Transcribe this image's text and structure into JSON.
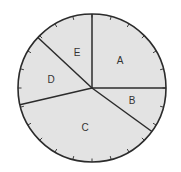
{
  "chart_data": {
    "type": "pie",
    "title": "",
    "categories": [
      "A",
      "B",
      "C",
      "D",
      "E"
    ],
    "values": [
      25,
      10,
      37,
      15,
      13
    ],
    "unit": "percent (estimated from angles)",
    "angles_deg": {
      "A": [
        0,
        90
      ],
      "E": [
        90,
        137
      ],
      "D": [
        137,
        193
      ],
      "C": [
        193,
        324
      ],
      "B": [
        324,
        360
      ]
    },
    "tick_marks": 24,
    "legend": "none (labels inside slices)",
    "grid": false
  },
  "style": {
    "fill": "#e3e3e3",
    "stroke": "#2b2b2b",
    "center": [
      92,
      88
    ],
    "radius": 74
  },
  "labels": {
    "A": "A",
    "B": "B",
    "C": "C",
    "D": "D",
    "E": "E"
  }
}
